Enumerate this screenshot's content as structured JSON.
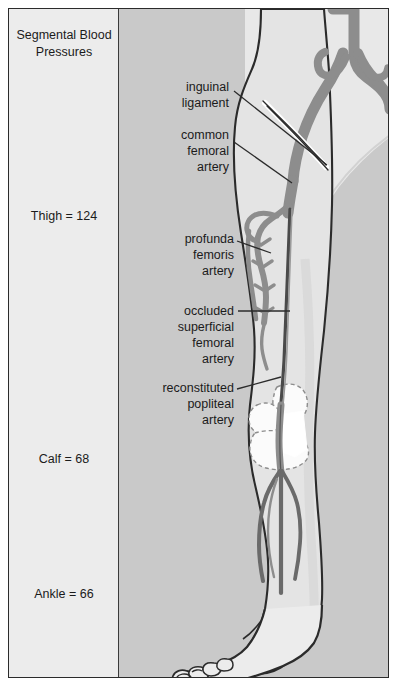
{
  "figure": {
    "panel_title": "Segmental\nBlood\nPressures",
    "pressures": [
      {
        "label": "Thigh = 124"
      },
      {
        "label": "Calf = 68"
      },
      {
        "label": "Ankle = 66"
      }
    ],
    "anatomy_labels": [
      {
        "text": "inguinal\nligament"
      },
      {
        "text": "common\nfemoral\nartery"
      },
      {
        "text": "profunda\nfemoris\nartery"
      },
      {
        "text": "occluded\nsuperficial\nfemoral\nartery"
      },
      {
        "text": "reconstituted\npopliteal\nartery"
      }
    ],
    "colors": {
      "artery": "#8d8d8d",
      "artery_outline": "#2b2b2b",
      "panel_background": "#c9c9c9",
      "data_panel_background": "#ececec",
      "limb_fill": "#e4e4e4",
      "text": "#1b1b1b",
      "border": "#2b2b2b"
    }
  }
}
